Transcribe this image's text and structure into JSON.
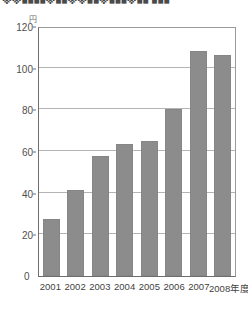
{
  "title": "※※■■■■※■■※※■■※■■■※■■ ■■■",
  "unit_label": "円",
  "zero_label": "0",
  "colors": {
    "bar": "#8c8c8c",
    "gridline": "#b4b4b4",
    "axis": "#6e6e6e",
    "frame": "#9a9a9a",
    "text": "#4f4f4f"
  },
  "chart_data": {
    "type": "bar",
    "title": "",
    "xlabel": "",
    "ylabel": "",
    "unit": "円",
    "categories": [
      "2001",
      "2002",
      "2003",
      "2004",
      "2005",
      "2006",
      "2007",
      "2008"
    ],
    "category_suffix": "年度",
    "values": [
      27.5,
      41.5,
      57.5,
      63.5,
      65,
      80,
      108,
      106
    ],
    "ylim": [
      0,
      120
    ],
    "yticks": [
      0,
      20,
      40,
      60,
      80,
      100,
      120
    ],
    "ytick_labels": [
      "0",
      "20",
      "40",
      "60",
      "80",
      "100",
      "120"
    ],
    "grid": true,
    "legend": "none",
    "series": [
      {
        "name": "",
        "values": [
          27.5,
          41.5,
          57.5,
          63.5,
          65,
          80,
          108,
          106
        ]
      }
    ]
  }
}
